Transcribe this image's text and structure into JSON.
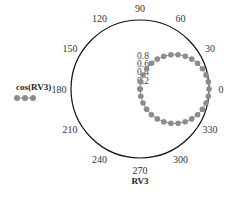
{
  "chart_data": {
    "type": "polar",
    "title": "",
    "xlabel": "RV3",
    "series": [
      {
        "name": "cos(RV3)",
        "function": "r = cos(theta)",
        "marker": "circle",
        "color": "#8c8c8c",
        "theta_deg": [
          -90,
          -84,
          -78,
          -72,
          -66,
          -60,
          -54,
          -48,
          -42,
          -36,
          -30,
          -24,
          -18,
          -12,
          -6,
          0,
          6,
          12,
          18,
          24,
          30,
          36,
          42,
          48,
          54,
          60,
          66,
          72,
          78,
          84,
          90
        ],
        "r": [
          0.0,
          0.105,
          0.208,
          0.309,
          0.407,
          0.5,
          0.588,
          0.669,
          0.743,
          0.809,
          0.866,
          0.914,
          0.951,
          0.978,
          0.995,
          1.0,
          0.995,
          0.978,
          0.951,
          0.914,
          0.866,
          0.809,
          0.743,
          0.669,
          0.588,
          0.5,
          0.407,
          0.309,
          0.208,
          0.105,
          0.0
        ]
      }
    ],
    "angular_ticks": [
      "0",
      "30",
      "60",
      "90",
      "120",
      "150",
      "180",
      "210",
      "240",
      "270",
      "300",
      "330"
    ],
    "angular_tick_values_deg": [
      0,
      30,
      60,
      90,
      120,
      150,
      180,
      210,
      240,
      270,
      300,
      330
    ],
    "radial_ticks": [
      "0.2",
      "0.4",
      "0.6",
      "0.8"
    ],
    "radial_tick_values": [
      0.2,
      0.4,
      0.6,
      0.8
    ],
    "rlim": [
      0,
      1
    ],
    "grid": false,
    "legend": {
      "position": "left",
      "entries": [
        "cos(RV3)"
      ]
    }
  },
  "labels": {
    "legend_label": "cos(RV3)",
    "axis_title": "RV3"
  }
}
